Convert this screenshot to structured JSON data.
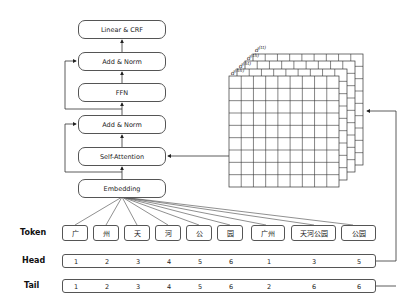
{
  "model_stack": {
    "linear_crf": "Linear & CRF",
    "add_norm_top": "Add & Norm",
    "ffn": "FFN",
    "add_norm_bottom": "Add & Norm",
    "self_attention": "Self-Attention",
    "embedding": "Embedding"
  },
  "matrix": {
    "labels": [
      {
        "base": "d",
        "sup": "(tt)"
      },
      {
        "base": "d",
        "sup": "(th)"
      },
      {
        "base": "d",
        "sup": "(ht)"
      },
      {
        "base": "d",
        "sup": "(hh)"
      }
    ],
    "rows": 9,
    "cols": 9
  },
  "rows": {
    "token_label": "Token",
    "head_label": "Head",
    "tail_label": "Tail"
  },
  "tokens": [
    "广",
    "州",
    "天",
    "河",
    "公",
    "园",
    "广州",
    "天河公园",
    "公园"
  ],
  "head": [
    "1",
    "2",
    "3",
    "4",
    "5",
    "6",
    "1",
    "3",
    "5"
  ],
  "tail": [
    "1",
    "2",
    "3",
    "4",
    "5",
    "6",
    "2",
    "6",
    "6"
  ]
}
